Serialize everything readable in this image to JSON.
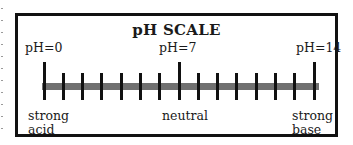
{
  "diagram": {
    "title": "pH SCALE",
    "scale": {
      "min": 0,
      "max": 14,
      "step": 1,
      "major_ticks": [
        0,
        7,
        14
      ]
    },
    "top_labels": [
      {
        "text": "pH=0",
        "value": 0
      },
      {
        "text": "pH=7",
        "value": 7
      },
      {
        "text": "pH=14",
        "value": 14
      }
    ],
    "bottom_labels": [
      {
        "line1": "strong",
        "line2": "acid",
        "value": 0
      },
      {
        "line1": "neutral",
        "line2": "",
        "value": 7
      },
      {
        "line1": "strong",
        "line2": "base",
        "value": 14
      }
    ],
    "colors": {
      "border": "#111111",
      "bar": "#707070",
      "tick": "#111111",
      "background": "#ffffff"
    }
  }
}
